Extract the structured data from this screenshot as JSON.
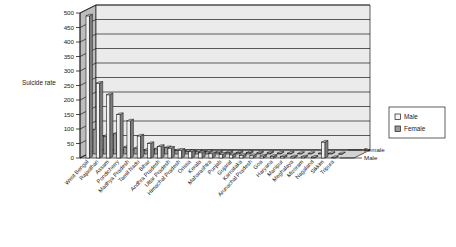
{
  "chart_data": {
    "type": "bar",
    "title": "",
    "subtitle": "",
    "xlabel": "",
    "ylabel": "Suicide rate",
    "ylim": [
      0,
      500
    ],
    "ytick_step": 50,
    "yticks": [
      "0",
      "50",
      "100",
      "150",
      "200",
      "250",
      "300",
      "350",
      "400",
      "450",
      "500"
    ],
    "grid": true,
    "projection": "3d",
    "legend_position": "right",
    "depth_axis_labels": [
      "Female",
      "Male"
    ],
    "categories": [
      "West Bengal",
      "Rajasthan",
      "Assam",
      "Pondicherry",
      "Madhya Pradesh",
      "Tamil Nadu",
      "Bihar",
      "Andhra Pradesh",
      "Uttar Pradesh",
      "Himachal Pradesh",
      "Orissa",
      "Kerala",
      "Maharashtra",
      "Punjab",
      "Gujarat",
      "Karnataka",
      "Arunachal Pradesh",
      "Goa",
      "Haryana",
      "Manipur",
      "Meghalaya",
      "Mizoram",
      "Nagaland",
      "Sikkim",
      "Tripura"
    ],
    "series": [
      {
        "name": "Male",
        "color": "#f2f2f2",
        "values": [
          490,
          258,
          218,
          150,
          128,
          76,
          50,
          40,
          34,
          27,
          22,
          18,
          15,
          13,
          11,
          9,
          8,
          7,
          6,
          5,
          4,
          4,
          3,
          55,
          2
        ]
      },
      {
        "name": "Female",
        "color": "#9a9a9a",
        "values": [
          84,
          62,
          70,
          24,
          20,
          14,
          18,
          22,
          12,
          10,
          9,
          8,
          7,
          6,
          5,
          5,
          4,
          4,
          3,
          3,
          2,
          2,
          2,
          2,
          1
        ]
      }
    ]
  },
  "legend": {
    "entries": [
      {
        "label": "Male",
        "swatch": "male-swatch"
      },
      {
        "label": "Female",
        "swatch": "female-swatch"
      }
    ]
  },
  "colors": {
    "wall": "#ebebeb",
    "floor": "#dcdcdc",
    "side_wall": "#bdbdbd",
    "gridline": "#222222",
    "male_bar": "#f4f4f4",
    "female_bar": "#9a9a9a",
    "bar_outline": "#1a1a1a",
    "background": "#ffffff"
  }
}
